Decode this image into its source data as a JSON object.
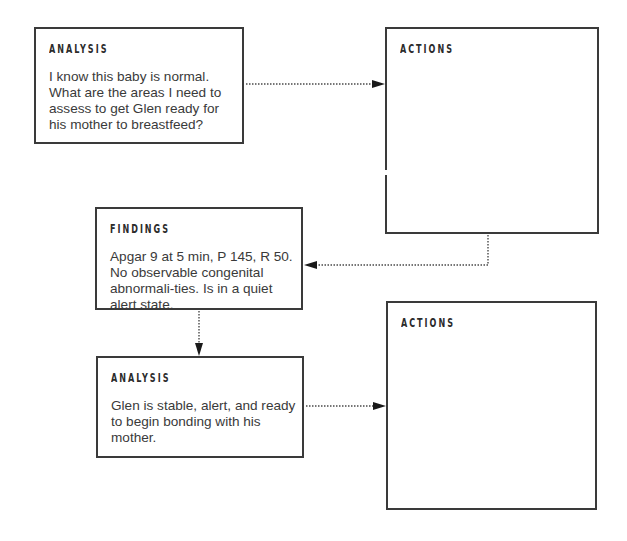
{
  "diagram": {
    "boxes": [
      {
        "id": "analysis-1",
        "title": "ANALYSIS",
        "body": "I know this baby is normal. What are the areas I need to assess to get Glen ready for his mother to breastfeed?"
      },
      {
        "id": "actions-1",
        "title": "ACTIONS",
        "body": ""
      },
      {
        "id": "findings",
        "title": "FINDINGS",
        "body": "Apgar 9 at 5 min, P 145, R 50. No observable congenital abnormali-ties. Is in a quiet alert state."
      },
      {
        "id": "analysis-2",
        "title": "ANALYSIS",
        "body": "Glen is stable, alert, and ready to begin bonding with his mother."
      },
      {
        "id": "actions-2",
        "title": "ACTIONS",
        "body": ""
      }
    ],
    "connectors": [
      {
        "from": "analysis-1",
        "to": "actions-1",
        "style": "dotted",
        "direction": "right"
      },
      {
        "from": "actions-1",
        "to": "findings",
        "style": "dotted",
        "direction": "left"
      },
      {
        "from": "findings",
        "to": "analysis-2",
        "style": "dotted",
        "direction": "down"
      },
      {
        "from": "analysis-2",
        "to": "actions-2",
        "style": "dotted",
        "direction": "right"
      }
    ],
    "colors": {
      "border": "#3a3a3a",
      "text": "#3a3a3a",
      "background": "#ffffff"
    }
  }
}
